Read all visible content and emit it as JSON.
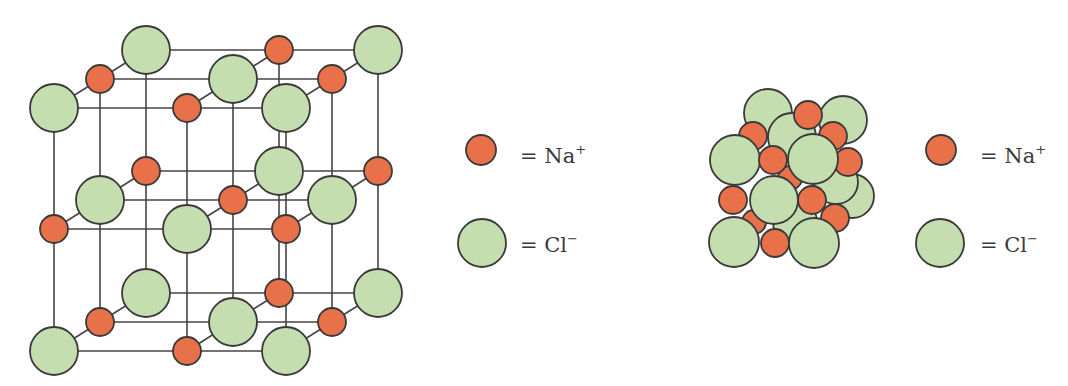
{
  "figure": {
    "colors": {
      "na_fill": "#e8714a",
      "cl_fill": "#c5deb0",
      "outline": "#3a3a3a",
      "bond": "#444444",
      "background": "#ffffff"
    },
    "radii": {
      "na": 14,
      "cl": 24
    }
  },
  "lattice_model": {
    "label": "ball-and-stick lattice",
    "origin_front": {
      "x": [
        54,
        187,
        286
      ],
      "y_layers": [
        108,
        229,
        351
      ]
    },
    "depth_step": {
      "dx": 46,
      "dy": -29
    },
    "layers": [
      {
        "name": "top",
        "rows": [
          [
            "Cl",
            "Na",
            "Cl"
          ],
          [
            "Na",
            "Cl",
            "Na"
          ],
          [
            "Cl",
            "Na",
            "Cl"
          ]
        ]
      },
      {
        "name": "middle",
        "rows": [
          [
            "Na",
            "Cl",
            "Na"
          ],
          [
            "Cl",
            "Na",
            "Cl"
          ],
          [
            "Na",
            "Cl",
            "Na"
          ]
        ]
      },
      {
        "name": "bottom",
        "rows": [
          [
            "Cl",
            "Na",
            "Cl"
          ],
          [
            "Na",
            "Cl",
            "Na"
          ],
          [
            "Cl",
            "Na",
            "Cl"
          ]
        ]
      }
    ]
  },
  "packing_model": {
    "label": "space-filling model",
    "atoms": [
      {
        "el": "Cl",
        "x": 768,
        "y": 113,
        "r": 24
      },
      {
        "el": "Cl",
        "x": 843,
        "y": 120,
        "r": 24
      },
      {
        "el": "Cl",
        "x": 792,
        "y": 137,
        "r": 24
      },
      {
        "el": "Na",
        "x": 808,
        "y": 115,
        "r": 14
      },
      {
        "el": "Cl",
        "x": 852,
        "y": 196,
        "r": 22
      },
      {
        "el": "Cl",
        "x": 836,
        "y": 182,
        "r": 22
      },
      {
        "el": "Na",
        "x": 753,
        "y": 136,
        "r": 14
      },
      {
        "el": "Na",
        "x": 833,
        "y": 136,
        "r": 14
      },
      {
        "el": "Na",
        "x": 790,
        "y": 178,
        "r": 12
      },
      {
        "el": "Na",
        "x": 754,
        "y": 222,
        "r": 12
      },
      {
        "el": "Cl",
        "x": 795,
        "y": 222,
        "r": 22
      },
      {
        "el": "Na",
        "x": 848,
        "y": 162,
        "r": 14
      },
      {
        "el": "Na",
        "x": 835,
        "y": 218,
        "r": 14
      },
      {
        "el": "Cl",
        "x": 735,
        "y": 160,
        "r": 25
      },
      {
        "el": "Na",
        "x": 773,
        "y": 160,
        "r": 14
      },
      {
        "el": "Cl",
        "x": 813,
        "y": 159,
        "r": 25
      },
      {
        "el": "Na",
        "x": 733,
        "y": 200,
        "r": 14
      },
      {
        "el": "Na",
        "x": 812,
        "y": 200,
        "r": 14
      },
      {
        "el": "Cl",
        "x": 774,
        "y": 200,
        "r": 24
      },
      {
        "el": "Cl",
        "x": 734,
        "y": 242,
        "r": 25
      },
      {
        "el": "Na",
        "x": 775,
        "y": 243,
        "r": 14
      },
      {
        "el": "Cl",
        "x": 814,
        "y": 243,
        "r": 25
      }
    ]
  },
  "legends": [
    {
      "id": "legend-left",
      "items": [
        {
          "el": "Na",
          "cx": 481,
          "cy": 150,
          "r": 15,
          "text_x": 520,
          "text_y": 163,
          "equals": "=",
          "symbol": "Na",
          "charge": "+"
        },
        {
          "el": "Cl",
          "cx": 482,
          "cy": 243,
          "r": 24,
          "text_x": 520,
          "text_y": 252,
          "equals": "=",
          "symbol": "Cl",
          "charge": "−"
        }
      ]
    },
    {
      "id": "legend-right",
      "items": [
        {
          "el": "Na",
          "cx": 941,
          "cy": 150,
          "r": 15,
          "text_x": 980,
          "text_y": 163,
          "equals": "=",
          "symbol": "Na",
          "charge": "+"
        },
        {
          "el": "Cl",
          "cx": 940,
          "cy": 243,
          "r": 24,
          "text_x": 980,
          "text_y": 252,
          "equals": "=",
          "symbol": "Cl",
          "charge": "−"
        }
      ]
    }
  ]
}
